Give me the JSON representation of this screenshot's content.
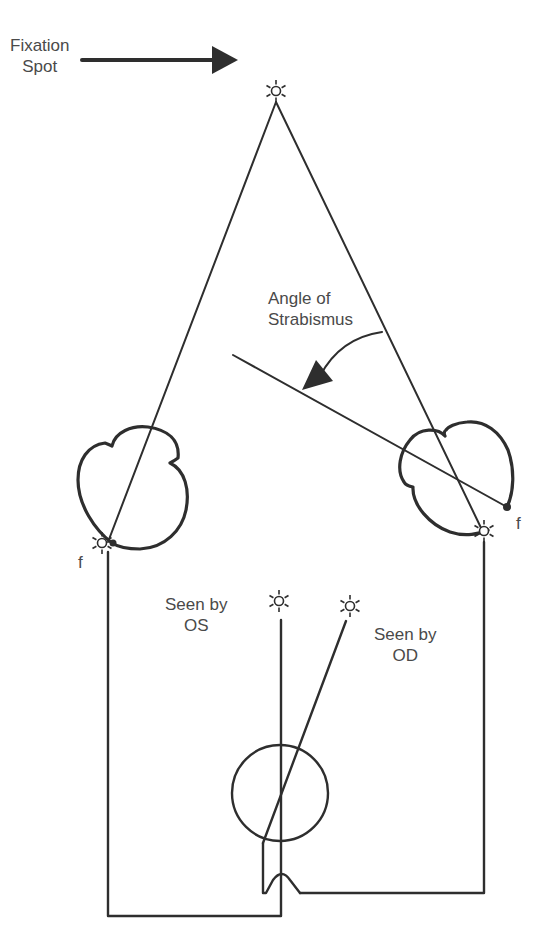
{
  "labels": {
    "fixation": {
      "line1": "Fixation",
      "line2": "Spot"
    },
    "angle": {
      "line1": "Angle of",
      "line2": "Strabismus"
    },
    "seen_os": {
      "line1": "Seen by",
      "line2": "OS"
    },
    "seen_od": {
      "line1": "Seen by",
      "line2": "OD"
    },
    "fovea_left": "f",
    "fovea_right": "f"
  },
  "colors": {
    "line": "#2e2e2e",
    "text": "#4a4a4a",
    "background": "#ffffff"
  },
  "icons": {
    "fixation_spot": "sun-star-icon",
    "image_os": "sun-star-icon",
    "image_od": "sun-star-icon"
  }
}
